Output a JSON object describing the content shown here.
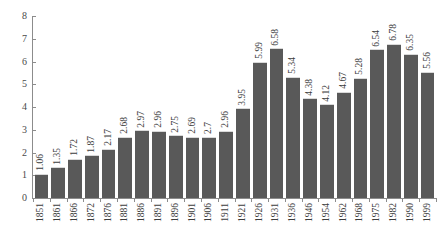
{
  "chart_data": {
    "type": "bar",
    "title": "",
    "subtitle": "",
    "xlabel": "",
    "ylabel": "",
    "ylim": [
      0,
      8
    ],
    "yticks": [
      0,
      1,
      2,
      3,
      4,
      5,
      6,
      7,
      8
    ],
    "grid": false,
    "legend": null,
    "bar_color": "#595959",
    "axis_color": "#8c8c8c",
    "categories": [
      "1851",
      "1861",
      "1866",
      "1872",
      "1876",
      "1881",
      "1886",
      "1891",
      "1896",
      "1901",
      "1906",
      "1911",
      "1921",
      "1926",
      "1931",
      "1936",
      "1946",
      "1954",
      "1962",
      "1968",
      "1975",
      "1982",
      "1990",
      "1999"
    ],
    "values": [
      1.06,
      1.35,
      1.72,
      1.87,
      2.17,
      2.68,
      2.97,
      2.96,
      2.75,
      2.69,
      2.7,
      2.96,
      3.95,
      5.99,
      6.58,
      5.34,
      4.38,
      4.12,
      4.67,
      5.28,
      6.54,
      6.78,
      6.35,
      5.56
    ],
    "value_labels": [
      "1.06",
      "1.35",
      "1.72",
      "1.87",
      "2.17",
      "2.68",
      "2.97",
      "2.96",
      "2.75",
      "2.69",
      "2.7",
      "2.96",
      "3.95",
      "5.99",
      "6.58",
      "5.34",
      "4.38",
      "4.12",
      "4.67",
      "5.28",
      "6.54",
      "6.78",
      "6.35",
      "5.56"
    ]
  }
}
